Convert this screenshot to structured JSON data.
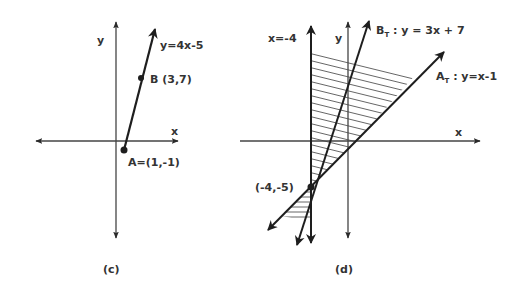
{
  "colors": {
    "ink": "#2a2a2a",
    "axis": "#444444",
    "hatch": "#555555",
    "background": "#ffffff"
  },
  "panels": [
    {
      "id": "c",
      "caption": "(c)",
      "axes": {
        "x_label": "x",
        "y_label": "y"
      },
      "line": {
        "equation_label": "y=4x-5"
      },
      "points": [
        {
          "name": "B",
          "label": "B (3,7)",
          "coords": [
            3,
            7
          ]
        },
        {
          "name": "A",
          "label": "A=(1,-1)",
          "coords": [
            1,
            -1
          ]
        }
      ]
    },
    {
      "id": "d",
      "caption": "(d)",
      "axes": {
        "x_label": "x",
        "y_label": "y"
      },
      "lines": [
        {
          "name": "vertical",
          "label": "x=-4"
        },
        {
          "name": "B_T",
          "label_main": "B",
          "label_sub": "T",
          "label_rest": " : y = 3x + 7"
        },
        {
          "name": "A_T",
          "label_main": "A",
          "label_sub": "T",
          "label_rest": " : y=x-1"
        }
      ],
      "intersection": {
        "label": "(-4,-5)",
        "coords": [
          -4,
          -5
        ]
      },
      "shaded_region": "bounded by x=-4 and A_T, containing B_T (horizontal hatching)"
    }
  ]
}
